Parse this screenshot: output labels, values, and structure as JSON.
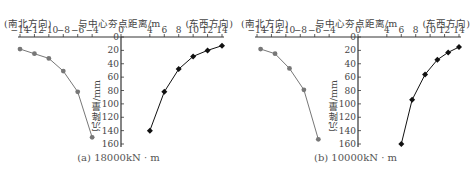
{
  "chart_data": [
    {
      "type": "line",
      "title": "(a) 18000kN · m",
      "xlabel": "与中心夯点距离/m",
      "ylabel": "沉降量/mm",
      "left_direction_label": "(南北方向)",
      "right_direction_label": "(东西方向)",
      "x_ticks": [
        -14,
        -12,
        -10,
        -8,
        -6,
        -4,
        0,
        4,
        6,
        8,
        10,
        12,
        14
      ],
      "y_ticks": [
        0,
        20,
        40,
        60,
        80,
        100,
        120,
        140,
        160
      ],
      "xlim": [
        -14,
        14
      ],
      "ylim": [
        0,
        160
      ],
      "y_inverted": true,
      "grid": false,
      "series": [
        {
          "name": "南北方向",
          "color": "#777777",
          "marker": "circle",
          "x": [
            -14,
            -12,
            -10,
            -8,
            -6,
            -4
          ],
          "y": [
            18,
            25,
            32,
            51,
            82,
            150
          ]
        },
        {
          "name": "东西方向",
          "color": "#111111",
          "marker": "diamond",
          "x": [
            4,
            6,
            8,
            10,
            12,
            14
          ],
          "y": [
            140,
            82,
            48,
            29,
            20,
            13
          ]
        }
      ]
    },
    {
      "type": "line",
      "title": "(b) 10000kN · m",
      "xlabel": "与中心夯点距离/m",
      "ylabel": "沉降量/mm",
      "left_direction_label": "(南北方向)",
      "right_direction_label": "(东西方向)",
      "x_ticks": [
        -14,
        -12,
        -10,
        -8,
        -6,
        -4,
        0,
        4,
        6,
        8,
        10,
        12,
        14
      ],
      "y_ticks": [
        0,
        20,
        40,
        60,
        80,
        100,
        120,
        140,
        160
      ],
      "xlim": [
        -14,
        14
      ],
      "ylim": [
        0,
        160
      ],
      "y_inverted": true,
      "grid": false,
      "series": [
        {
          "name": "南北方向",
          "color": "#777777",
          "marker": "circle",
          "x": [
            -13.5,
            -11.5,
            -9.5,
            -7.5,
            -5.5
          ],
          "y": [
            18,
            25,
            47,
            79,
            153
          ]
        },
        {
          "name": "东西方向",
          "color": "#111111",
          "marker": "diamond",
          "x": [
            6,
            7.5,
            9.3,
            11,
            12.5,
            14
          ],
          "y": [
            160,
            94,
            56,
            34,
            23,
            15
          ]
        }
      ]
    }
  ]
}
